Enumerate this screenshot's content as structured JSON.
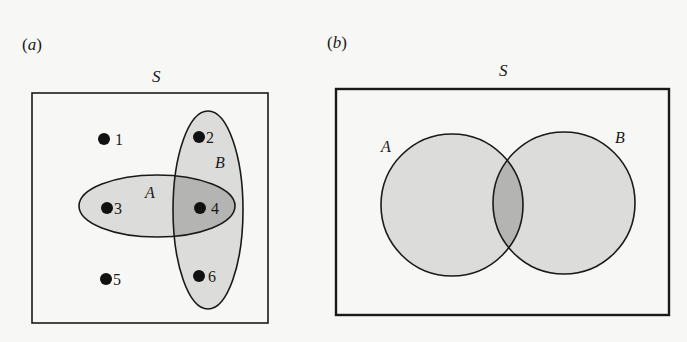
{
  "panels": [
    {
      "id": "a",
      "panel_label": "(a)",
      "universe_label": "S",
      "set_labels": {
        "A": "A",
        "B": "B"
      },
      "points": [
        {
          "label": "1",
          "sets": []
        },
        {
          "label": "2",
          "sets": [
            "B"
          ]
        },
        {
          "label": "3",
          "sets": [
            "A"
          ]
        },
        {
          "label": "4",
          "sets": [
            "A",
            "B"
          ]
        },
        {
          "label": "5",
          "sets": []
        },
        {
          "label": "6",
          "sets": [
            "B"
          ]
        }
      ]
    },
    {
      "id": "b",
      "panel_label": "(b)",
      "universe_label": "S",
      "set_labels": {
        "A": "A",
        "B": "B"
      }
    }
  ],
  "colors": {
    "background": "#f7f7f5",
    "set_fill": "#dcdcda",
    "intersection_fill": "#b4b4b2",
    "stroke": "#1a1a1a"
  }
}
